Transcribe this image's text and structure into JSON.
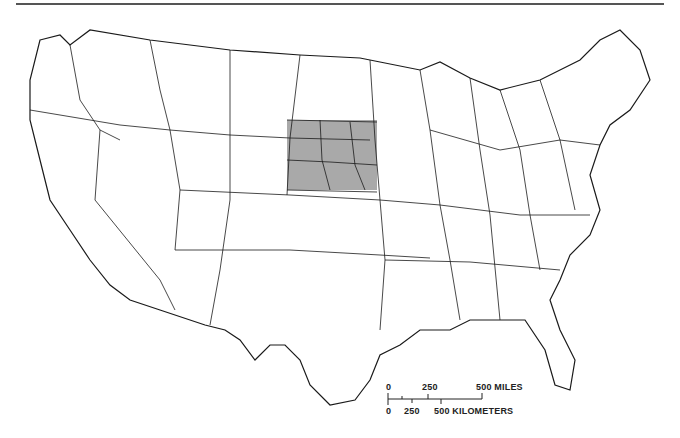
{
  "map": {
    "type": "reference map",
    "subject": "Conterminous United States with subdivision boundaries",
    "highlighted_region": {
      "description": "Shaded study area in the central Great Plains",
      "fill": "#9a9a9a",
      "approx_bbox_px": [
        287,
        120,
        377,
        190
      ]
    },
    "colors": {
      "line": "#1a1a1a",
      "background": "#ffffff",
      "shade": "#9a9a9a"
    }
  },
  "scale_bar": {
    "miles": {
      "ticks": [
        "0",
        "250",
        "500 MILES"
      ]
    },
    "kilometers": {
      "ticks": [
        "0",
        "250",
        "500 KILOMETERS"
      ]
    }
  }
}
